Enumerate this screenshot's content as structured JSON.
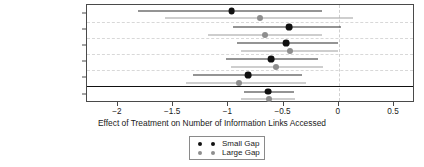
{
  "chart_data": {
    "type": "scatter",
    "subtype": "forest-plot",
    "title": "",
    "xlabel": "Effect of Treatment on Number of Information Links Accessed",
    "ylabel": "",
    "xlim": [
      -2.28,
      0.69
    ],
    "xticks": [
      -2,
      -1.5,
      -1,
      -0.5,
      0,
      0.5
    ],
    "xticklabels": [
      "−2",
      "−1.5",
      "−1",
      "−0.5",
      "0",
      "0.5"
    ],
    "grid": true,
    "legend_position": "bottom-center",
    "reference_line": 0,
    "categories": [
      "Canada 2014",
      "Australia 2016",
      "Canada 2016",
      "England 2016",
      "New Zealand 2016",
      "Pooled Effect"
    ],
    "series": [
      {
        "name": "Small Gap",
        "color": "#111111",
        "values": [
          -0.97,
          -0.45,
          -0.48,
          -0.61,
          -0.82,
          -0.64
        ],
        "ci_low": [
          -1.82,
          -0.96,
          -0.92,
          -1.02,
          -1.32,
          -0.86
        ],
        "ci_high": [
          -0.15,
          0.02,
          -0.01,
          -0.19,
          -0.33,
          -0.41
        ]
      },
      {
        "name": "Large Gap",
        "color": "#8e8e8e",
        "values": [
          -0.71,
          -0.67,
          -0.44,
          -0.57,
          -0.9,
          -0.63
        ],
        "ci_low": [
          -1.57,
          -1.18,
          -0.89,
          -0.98,
          -1.38,
          -0.89
        ],
        "ci_high": [
          0.13,
          -0.15,
          -0.01,
          -0.14,
          -0.3,
          -0.4
        ]
      }
    ]
  },
  "yaxis": {
    "labels": [
      "Canada 2014",
      "Australia 2016",
      "Canada 2016",
      "England 2016",
      "New Zealand 2016",
      "Pooled Effect"
    ]
  },
  "xaxis": {
    "title": "Effect of Treatment on Number of Information Links Accessed",
    "ticklabels": [
      "−2",
      "−1.5",
      "−1",
      "−0.5",
      "0",
      "0.5"
    ]
  },
  "legend": {
    "entries": [
      {
        "label": "Small Gap",
        "color": "#111111"
      },
      {
        "label": "Large Gap",
        "color": "#8e8e8e"
      }
    ]
  }
}
